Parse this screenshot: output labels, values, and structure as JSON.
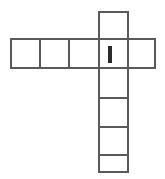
{
  "figure": {
    "type": "cube-net-diagram",
    "background_color": "#ffffff",
    "line_color": "#5a5a5a",
    "mark_color": "#2b2b2b",
    "cell_size": 29,
    "stroke_width": 1.6,
    "grid": {
      "columns": 5,
      "rows": 6,
      "origin_x": 11,
      "origin_y": 12
    },
    "cells": [
      {
        "name": "top-square",
        "col": 3,
        "row": 0,
        "x": 99,
        "y": 12
      },
      {
        "name": "row-square-1",
        "col": 0,
        "row": 1,
        "x": 11,
        "y": 39
      },
      {
        "name": "row-square-2",
        "col": 1,
        "row": 1,
        "x": 40,
        "y": 39
      },
      {
        "name": "row-square-3",
        "col": 2,
        "row": 1,
        "x": 69,
        "y": 39
      },
      {
        "name": "center-square",
        "col": 3,
        "row": 1,
        "x": 99,
        "y": 39
      },
      {
        "name": "row-square-5",
        "col": 4,
        "row": 1,
        "x": 128,
        "y": 39
      },
      {
        "name": "column-square-1",
        "col": 3,
        "row": 2,
        "x": 99,
        "y": 68
      },
      {
        "name": "column-square-2",
        "col": 3,
        "row": 3,
        "x": 99,
        "y": 98
      },
      {
        "name": "column-square-3",
        "col": 3,
        "row": 4,
        "x": 99,
        "y": 127
      },
      {
        "name": "column-square-4",
        "col": 3,
        "row": 5,
        "x": 99,
        "y": 155
      }
    ],
    "mark": {
      "label": "I",
      "description": "thick vertical tally bar inside center square",
      "x": 108,
      "y": 46,
      "width": 4,
      "height": 17
    },
    "cell_count": 10,
    "row_cell_count": 5,
    "column_cell_count": 6
  }
}
